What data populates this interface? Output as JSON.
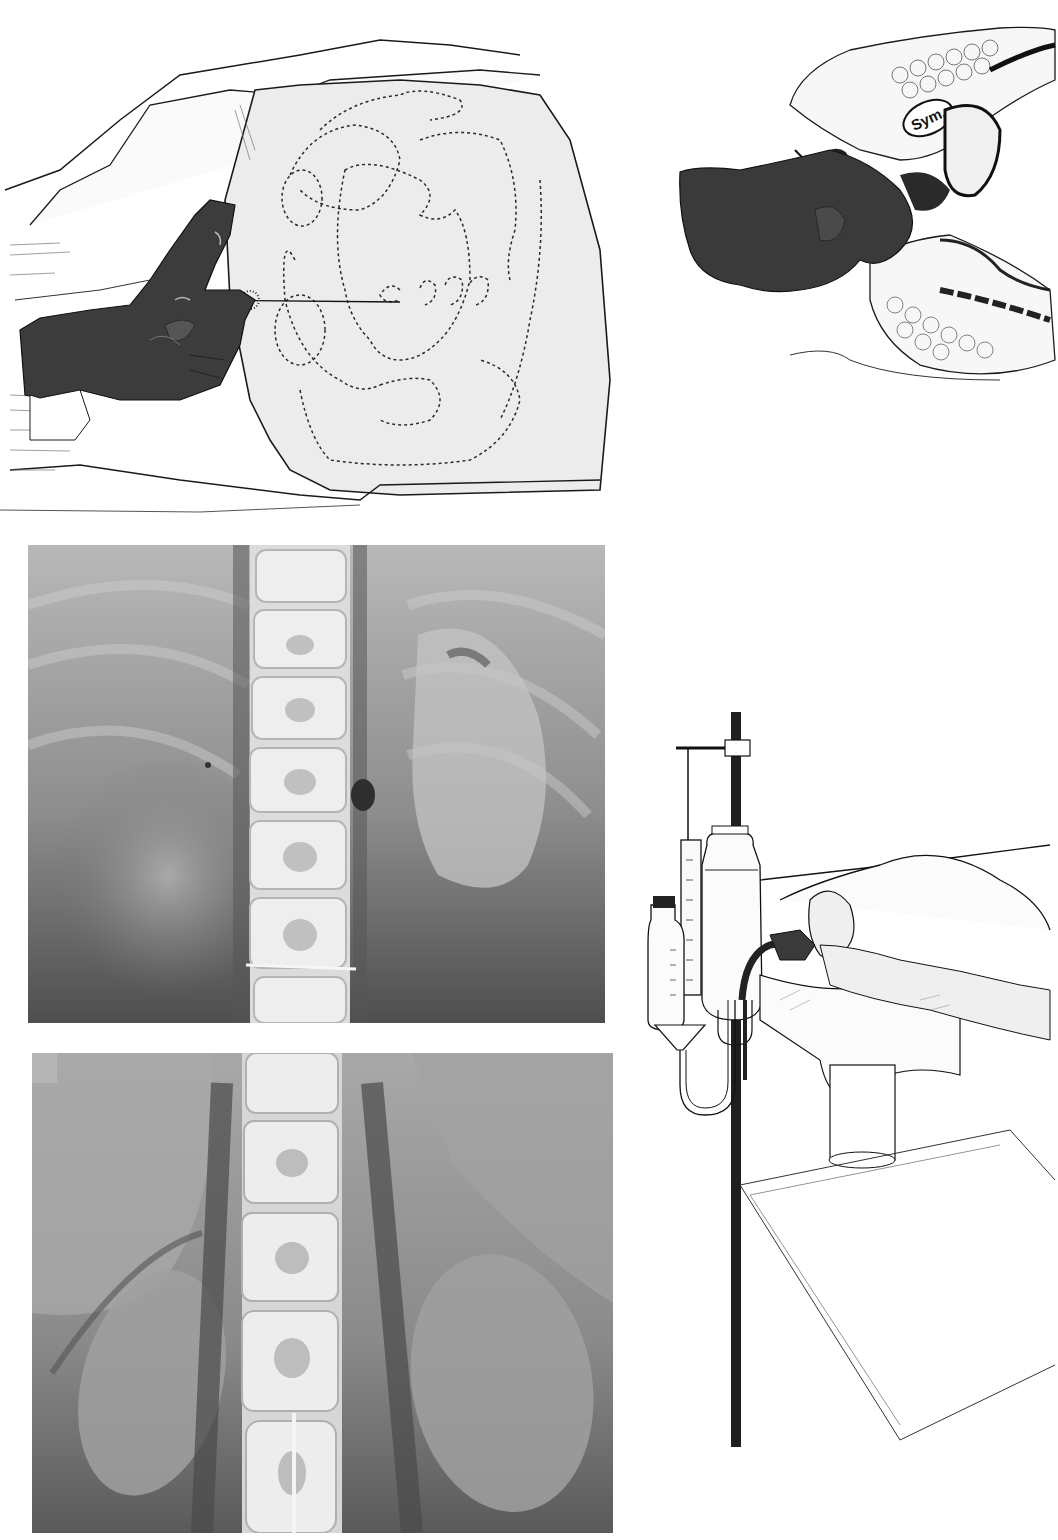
{
  "page": {
    "background": "#ffffff",
    "clipped_top_text": ""
  },
  "figures": [
    {
      "id": "fig-external-puncture",
      "kind": "line-drawing",
      "subject": "gloved-hand-inserting-needle-into-abdomen-with-dotted-organ-outlines",
      "bbox": [
        0,
        30,
        620,
        515
      ]
    },
    {
      "id": "fig-sagittal-pelvis",
      "kind": "line-drawing",
      "subject": "sagittal-section-pelvis-with-gloved-hand-and-catheter",
      "bbox": [
        665,
        25,
        1058,
        370
      ],
      "labels": [
        {
          "text": "Sym.",
          "x": 928,
          "y": 118
        }
      ]
    },
    {
      "id": "fig-xray-1",
      "kind": "radiograph",
      "subject": "abdominal-xray-lumbar-spine-with-contrast",
      "bbox": [
        28,
        545,
        605,
        1023
      ]
    },
    {
      "id": "fig-xray-2",
      "kind": "radiograph",
      "subject": "abdominal-xray-lumbar-spine-kidney-shadows",
      "bbox": [
        32,
        1053,
        613,
        1533
      ]
    },
    {
      "id": "fig-irrigation-apparatus",
      "kind": "line-drawing",
      "subject": "stand-with-reservoir-bottles-tubing-and-patient-on-table",
      "bbox": [
        630,
        710,
        1058,
        1460
      ]
    }
  ],
  "colors": {
    "ink": "#1a1a1a",
    "glove": "#3c3c3c",
    "xray_dark": "#4e4e4e",
    "xray_mid": "#8c8c8c",
    "xray_light": "#c9c9c9",
    "bone": "#e6e6e6",
    "skin": "#ececec"
  }
}
